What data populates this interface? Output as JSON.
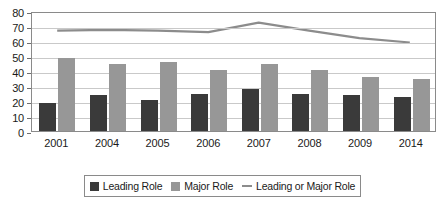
{
  "chart_data": {
    "type": "bar",
    "title": "",
    "xlabel": "",
    "ylabel": "",
    "ylim": [
      0,
      80
    ],
    "ytick_step": 10,
    "yticks": [
      80,
      70,
      60,
      50,
      40,
      30,
      20,
      10,
      0
    ],
    "grid": true,
    "legend_position": "bottom",
    "categories": [
      "2001",
      "2004",
      "2005",
      "2006",
      "2007",
      "2008",
      "2009",
      "2014"
    ],
    "series": [
      {
        "name": "Leading Role",
        "type": "bar",
        "color": "#3a3a3a",
        "values": [
          19,
          24,
          21,
          25,
          28,
          24.5,
          24,
          23
        ]
      },
      {
        "name": "Major Role",
        "type": "bar",
        "color": "#979797",
        "values": [
          48.5,
          44.5,
          46,
          41,
          45,
          40.5,
          36,
          35
        ]
      },
      {
        "name": "Leading or Major Role",
        "type": "line",
        "color": "#8c8c8c",
        "values": [
          68,
          68.5,
          68,
          67,
          73.5,
          68,
          63,
          60
        ]
      }
    ]
  },
  "legend": {
    "items": [
      {
        "label": "Leading Role",
        "marker": "square-dark-icon"
      },
      {
        "label": "Major Role",
        "marker": "square-gray-icon"
      },
      {
        "label": "Leading or Major Role",
        "marker": "line-gray-icon"
      }
    ]
  }
}
